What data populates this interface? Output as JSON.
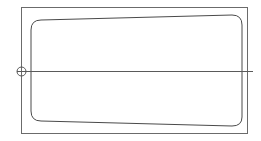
{
  "document": {
    "title": "Technical Outline Drawing",
    "background_color": "#ffffff",
    "width": 261,
    "height": 141
  },
  "style": {
    "outer_frame_color": "#6b6b6b",
    "outer_frame_width": 1,
    "inner_outline_color": "#4a4a4a",
    "inner_outline_width": 1,
    "center_line_color": "#5a5a5a",
    "center_line_width": 1,
    "origin_marker_color": "#555555",
    "origin_marker_width": 1
  },
  "geometry": {
    "outer_frame": {
      "name": "outer-boundary-rectangle",
      "x": 21,
      "y": 7,
      "width": 226,
      "height": 126
    },
    "inner_outline": {
      "name": "inner-rounded-profile",
      "corner_radius": 10,
      "path": "M 41 20 L 232 15 Q 242 15 242 25 L 242 117 Q 242 126 232 126 L 41 121 Q 31 121 31 111 L 31 30 Q 31 20 41 20 Z",
      "points": [
        {
          "label": "top-left",
          "x": 31,
          "y": 22
        },
        {
          "label": "top-right",
          "x": 242,
          "y": 17
        },
        {
          "label": "bottom-right",
          "x": 242,
          "y": 124
        },
        {
          "label": "bottom-left",
          "x": 31,
          "y": 118
        }
      ]
    },
    "center_line": {
      "name": "horizontal-center-axis",
      "x1": 17,
      "y1": 71,
      "x2": 253,
      "y2": 71
    },
    "origin_marker": {
      "name": "origin-reference-circle",
      "cx": 21.5,
      "cy": 71.5,
      "r": 4.5
    }
  }
}
